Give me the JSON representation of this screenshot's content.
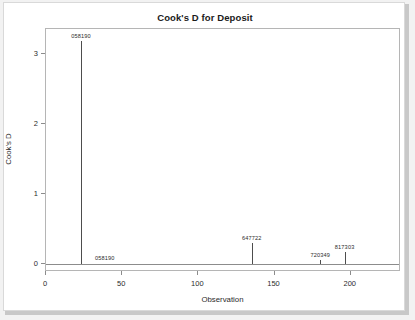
{
  "chart_data": {
    "type": "scatter",
    "title": "Cook's D for Deposit",
    "xlabel": "Observation",
    "ylabel": "Cook's D",
    "xlim": [
      0,
      233
    ],
    "ylim": [
      -0.12,
      3.35
    ],
    "xticks": [
      "0",
      "50",
      "100",
      "150",
      "200"
    ],
    "xtickvalues": [
      0,
      50,
      100,
      150,
      200
    ],
    "yticks": [
      "0",
      "1",
      "2",
      "3"
    ],
    "ytickvalues": [
      0,
      1,
      2,
      3
    ],
    "grid": false,
    "legend": null,
    "reference_line": 0,
    "points": [
      {
        "x": 23,
        "y": 3.18,
        "label": "058190",
        "label_position": "above"
      },
      {
        "x": 23,
        "y": 0.0,
        "label": "058190",
        "label_position": "baseline"
      },
      {
        "x": 135,
        "y": 0.3,
        "label": "647722",
        "label_position": "above"
      },
      {
        "x": 180,
        "y": 0.05,
        "label": "720349",
        "label_position": "above"
      },
      {
        "x": 196,
        "y": 0.16,
        "label": "817303",
        "label_position": "above"
      }
    ]
  },
  "figure": {
    "title": "Cook's D for Deposit",
    "x_axis_title": "Observation",
    "y_axis_title": "Cook's D",
    "x_tick_labels": [
      "0",
      "50",
      "100",
      "150",
      "200"
    ],
    "y_tick_labels": [
      "0",
      "1",
      "2",
      "3"
    ],
    "labels": {
      "peak": "058190",
      "peak_base": "058190",
      "mid": "647722",
      "small": "720349",
      "right": "817303"
    }
  },
  "colors": {
    "background": "#ffffff",
    "panel_border": "#d9d9d9",
    "shadow": "#c8c8c8",
    "frame": "#b5b5b5",
    "needle": "#4d4d4d",
    "baseline": "#8c8c8c",
    "text": "#2b2b2b",
    "title": "#1a1a1a"
  }
}
